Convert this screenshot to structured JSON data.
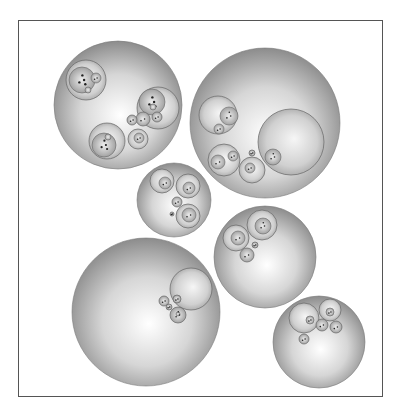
{
  "diagram": {
    "type": "nested-circle-packing",
    "frame": {
      "x": 18,
      "y": 20,
      "width": 365,
      "height": 377,
      "stroke": "#555555"
    },
    "colors": {
      "sphere_light": "#ffffff",
      "sphere_mid": "#d4d4d4",
      "sphere_dark": "#8a8a8a",
      "outline": "#666666",
      "leaf": "#222222"
    },
    "clusters": [
      {
        "id": "cluster-top-left",
        "cx": 118,
        "cy": 105,
        "r": 64,
        "children": [
          {
            "cx": 86,
            "cy": 80,
            "r": 20,
            "children": [
              {
                "cx": 82,
                "cy": 80,
                "r": 13
              },
              {
                "cx": 96,
                "cy": 78,
                "r": 5
              },
              {
                "cx": 88,
                "cy": 90,
                "r": 3
              }
            ]
          },
          {
            "cx": 158,
            "cy": 108,
            "r": 21,
            "children": [
              {
                "cx": 152,
                "cy": 102,
                "r": 13
              },
              {
                "cx": 153,
                "cy": 107,
                "r": 3
              }
            ]
          },
          {
            "cx": 107,
            "cy": 141,
            "r": 18,
            "children": [
              {
                "cx": 104,
                "cy": 145,
                "r": 12
              },
              {
                "cx": 108,
                "cy": 137,
                "r": 3
              }
            ]
          },
          {
            "cx": 143,
            "cy": 119,
            "r": 7,
            "children": []
          },
          {
            "cx": 138,
            "cy": 139,
            "r": 10,
            "children": [
              {
                "cx": 139,
                "cy": 138,
                "r": 5
              }
            ]
          },
          {
            "cx": 132,
            "cy": 120,
            "r": 5,
            "children": []
          },
          {
            "cx": 157,
            "cy": 117,
            "r": 5,
            "children": []
          }
        ]
      },
      {
        "id": "cluster-top-right",
        "cx": 265,
        "cy": 123,
        "r": 75,
        "children": [
          {
            "cx": 291,
            "cy": 142,
            "r": 33,
            "children": [
              {
                "cx": 273,
                "cy": 157,
                "r": 8
              }
            ]
          },
          {
            "cx": 218,
            "cy": 115,
            "r": 19,
            "children": [
              {
                "cx": 229,
                "cy": 116,
                "r": 9
              },
              {
                "cx": 219,
                "cy": 129,
                "r": 5
              }
            ]
          },
          {
            "cx": 224,
            "cy": 160,
            "r": 16,
            "children": [
              {
                "cx": 233,
                "cy": 156,
                "r": 5
              },
              {
                "cx": 218,
                "cy": 162,
                "r": 7
              }
            ]
          },
          {
            "cx": 252,
            "cy": 170,
            "r": 13,
            "children": [
              {
                "cx": 250,
                "cy": 168,
                "r": 5
              }
            ]
          },
          {
            "cx": 252,
            "cy": 153,
            "r": 3,
            "children": []
          }
        ]
      },
      {
        "id": "cluster-middle-left",
        "cx": 174,
        "cy": 200,
        "r": 37,
        "children": [
          {
            "cx": 162,
            "cy": 181,
            "r": 12,
            "children": [
              {
                "cx": 165,
                "cy": 183,
                "r": 6
              }
            ]
          },
          {
            "cx": 188,
            "cy": 186,
            "r": 12,
            "children": [
              {
                "cx": 189,
                "cy": 188,
                "r": 6
              }
            ]
          },
          {
            "cx": 188,
            "cy": 216,
            "r": 12,
            "children": [
              {
                "cx": 189,
                "cy": 215,
                "r": 7
              }
            ]
          },
          {
            "cx": 177,
            "cy": 202,
            "r": 5,
            "children": []
          },
          {
            "cx": 172,
            "cy": 214,
            "r": 2,
            "children": []
          }
        ]
      },
      {
        "id": "cluster-middle-right",
        "cx": 265,
        "cy": 257,
        "r": 51,
        "children": [
          {
            "cx": 262,
            "cy": 225,
            "r": 15,
            "children": [
              {
                "cx": 263,
                "cy": 226,
                "r": 8
              }
            ]
          },
          {
            "cx": 236,
            "cy": 238,
            "r": 13,
            "children": [
              {
                "cx": 238,
                "cy": 238,
                "r": 7
              }
            ]
          },
          {
            "cx": 247,
            "cy": 255,
            "r": 7,
            "children": []
          },
          {
            "cx": 255,
            "cy": 245,
            "r": 3,
            "children": []
          }
        ]
      },
      {
        "id": "cluster-bottom-left",
        "cx": 146,
        "cy": 312,
        "r": 74,
        "children": [
          {
            "cx": 191,
            "cy": 289,
            "r": 21,
            "children": []
          },
          {
            "cx": 164,
            "cy": 301,
            "r": 5,
            "children": []
          },
          {
            "cx": 177,
            "cy": 299,
            "r": 4,
            "children": []
          },
          {
            "cx": 178,
            "cy": 315,
            "r": 8,
            "children": [
              {
                "cx": 178,
                "cy": 314,
                "r": 2
              }
            ]
          },
          {
            "cx": 169,
            "cy": 307,
            "r": 3,
            "children": []
          }
        ]
      },
      {
        "id": "cluster-bottom-right",
        "cx": 319,
        "cy": 342,
        "r": 46,
        "children": [
          {
            "cx": 304,
            "cy": 318,
            "r": 15,
            "children": [
              {
                "cx": 310,
                "cy": 320,
                "r": 4
              }
            ]
          },
          {
            "cx": 330,
            "cy": 310,
            "r": 11,
            "children": [
              {
                "cx": 330,
                "cy": 312,
                "r": 4
              }
            ]
          },
          {
            "cx": 322,
            "cy": 325,
            "r": 6,
            "children": []
          },
          {
            "cx": 336,
            "cy": 327,
            "r": 6,
            "children": []
          },
          {
            "cx": 304,
            "cy": 339,
            "r": 5,
            "children": []
          }
        ]
      }
    ]
  }
}
